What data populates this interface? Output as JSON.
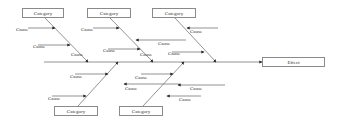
{
  "diagram": {
    "type": "fishbone",
    "effect": {
      "label": "Effect",
      "x": 262,
      "y": 57,
      "w": 63,
      "h": 10
    },
    "spine": {
      "x1": 44,
      "x2": 262,
      "y": 62
    },
    "categories": [
      {
        "label": "Category",
        "x": 22,
        "y": 8,
        "w": 42,
        "h": 10,
        "line": [
          45,
          18,
          88,
          62
        ]
      },
      {
        "label": "Category",
        "x": 87,
        "y": 8,
        "w": 44,
        "h": 10,
        "line": [
          110,
          18,
          153,
          62
        ]
      },
      {
        "label": "Category",
        "x": 152,
        "y": 8,
        "w": 44,
        "h": 10,
        "line": [
          175,
          18,
          216,
          62
        ]
      },
      {
        "label": "Category",
        "x": 54,
        "y": 106,
        "w": 44,
        "h": 10,
        "line": [
          78,
          106,
          118,
          62
        ]
      },
      {
        "label": "Category",
        "x": 119,
        "y": 106,
        "w": 44,
        "h": 10,
        "line": [
          143,
          106,
          184,
          62
        ]
      }
    ],
    "causes": [
      {
        "label": "Cause",
        "lx": 16,
        "ly": 31,
        "line": [
          28,
          28,
          55,
          28
        ]
      },
      {
        "label": "Cause",
        "lx": 33,
        "ly": 48,
        "line": [
          38,
          45,
          70,
          45
        ]
      },
      {
        "label": "Cause",
        "lx": 81,
        "ly": 31,
        "line": [
          93,
          28,
          119,
          28
        ]
      },
      {
        "label": "Cause",
        "lx": 158,
        "ly": 45,
        "line": [
          186,
          40,
          136,
          40
        ]
      },
      {
        "label": "Cause",
        "lx": 103,
        "ly": 52,
        "line": [
          108,
          49,
          140,
          49
        ]
      },
      {
        "label": "Cause",
        "lx": 190,
        "ly": 33,
        "line": [
          218,
          28,
          187,
          28
        ]
      },
      {
        "label": "Cause",
        "lx": 168,
        "ly": 55,
        "line": [
          172,
          52,
          204,
          52
        ]
      },
      {
        "label": "Cause",
        "lx": 71,
        "ly": 56,
        "line": []
      },
      {
        "label": "Cause",
        "lx": 140,
        "ly": 56,
        "line": []
      },
      {
        "label": "Cause",
        "lx": 70,
        "ly": 78,
        "line": [
          75,
          74,
          108,
          74
        ]
      },
      {
        "label": "Cause",
        "lx": 125,
        "ly": 90,
        "line": [
          180,
          84,
          124,
          84
        ]
      },
      {
        "label": "Cause",
        "lx": 48,
        "ly": 100,
        "line": [
          52,
          96,
          86,
          96
        ]
      },
      {
        "label": "Cause",
        "lx": 135,
        "ly": 79,
        "line": [
          141,
          74,
          173,
          74
        ]
      },
      {
        "label": "Cause",
        "lx": 190,
        "ly": 90,
        "line": [
          225,
          85,
          178,
          85
        ]
      },
      {
        "label": "Cause",
        "lx": 179,
        "ly": 101,
        "line": [
          201,
          96,
          167,
          96
        ]
      }
    ]
  }
}
